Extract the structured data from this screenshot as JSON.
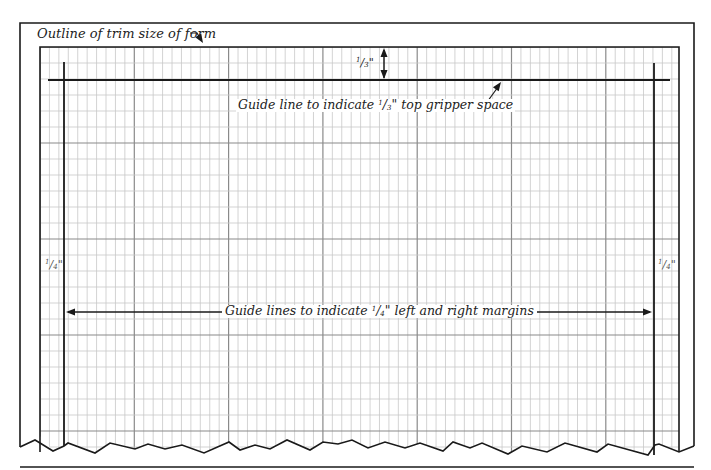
{
  "diagram": {
    "title_label": "Outline of trim size of form",
    "gripper_label": {
      "prefix": "Guide line to indicate ",
      "frac_num": "1",
      "frac_den": "3",
      "suffix": "\" top gripper space"
    },
    "gripper_measure": {
      "frac_num": "1",
      "frac_den": "3",
      "unit": "\""
    },
    "margins_label": {
      "prefix": "Guide lines to indicate ",
      "frac_num": "1",
      "frac_den": "4",
      "suffix": "\" left and right margins"
    },
    "left_margin_measure": {
      "frac_num": "1",
      "frac_den": "4",
      "unit": "\""
    },
    "right_margin_measure": {
      "frac_num": "1",
      "frac_den": "4",
      "unit": "\""
    },
    "colors": {
      "line": "#1a1a1a",
      "grid_minor": "#c8c8c8",
      "grid_major": "#8a8a8a",
      "background": "#ffffff"
    },
    "geometry": {
      "trim": {
        "left": 20,
        "top": 23,
        "right": 694
      },
      "grid": {
        "left": 40,
        "top": 47,
        "right": 679,
        "cell_w": 9.43,
        "cell_h": 16,
        "major_every_x": 10,
        "major_every_y": 6
      },
      "gripper_line_y": 80,
      "left_margin_x": 64,
      "right_margin_x": 654,
      "bottom_rule_y": 467
    }
  }
}
